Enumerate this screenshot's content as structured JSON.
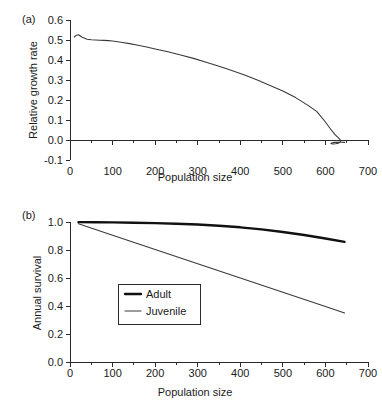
{
  "figure": {
    "panel_a_label": "(a)",
    "panel_b_label": "(b)",
    "xlabel": "Population size",
    "panel_a_ylabel": "Relative growth rate",
    "panel_b_ylabel": "Annual survival"
  },
  "chart_data": [
    {
      "type": "line",
      "panel": "(a)",
      "title": "",
      "xlabel": "Population size",
      "ylabel": "Relative growth rate",
      "xlim": [
        0,
        700
      ],
      "ylim": [
        -0.1,
        0.6
      ],
      "xticks": [
        0,
        100,
        200,
        300,
        400,
        500,
        600,
        700
      ],
      "xtick_labels": [
        "0",
        "100",
        "200",
        "300",
        "400",
        "500",
        "600",
        "700"
      ],
      "minor_xtick_step": 50,
      "yticks": [
        -0.1,
        0.0,
        0.1,
        0.2,
        0.3,
        0.4,
        0.5,
        0.6
      ],
      "ytick_labels": [
        "-0.1",
        "0.0",
        "0.1",
        "0.2",
        "0.3",
        "0.4",
        "0.5",
        "0.6"
      ],
      "grid": false,
      "legend": null,
      "series": [
        {
          "name": "Relative growth rate",
          "style": "thin-line",
          "color": "#3a3a3a",
          "x": [
            10,
            15,
            20,
            25,
            30,
            40,
            50,
            60,
            70,
            80,
            90,
            100,
            120,
            140,
            160,
            180,
            200,
            230,
            260,
            290,
            320,
            350,
            380,
            410,
            440,
            470,
            500,
            530,
            560,
            580,
            600,
            612,
            622,
            630,
            634,
            636,
            634,
            630,
            624,
            618,
            614,
            613,
            616,
            622,
            630,
            638,
            645
          ],
          "y": [
            0.515,
            0.524,
            0.526,
            0.519,
            0.512,
            0.504,
            0.501,
            0.5,
            0.499,
            0.498,
            0.497,
            0.495,
            0.489,
            0.482,
            0.474,
            0.465,
            0.455,
            0.441,
            0.425,
            0.408,
            0.389,
            0.369,
            0.348,
            0.325,
            0.3,
            0.273,
            0.245,
            0.212,
            0.172,
            0.142,
            0.09,
            0.055,
            0.028,
            0.012,
            0.003,
            -0.004,
            -0.011,
            -0.016,
            -0.019,
            -0.02,
            -0.019,
            -0.017,
            -0.014,
            -0.012,
            -0.011,
            -0.011,
            -0.012
          ]
        }
      ]
    },
    {
      "type": "line",
      "panel": "(b)",
      "title": "",
      "xlabel": "Population size",
      "ylabel": "Annual survival",
      "xlim": [
        0,
        700
      ],
      "ylim": [
        0.0,
        1.0
      ],
      "xticks": [
        0,
        100,
        200,
        300,
        400,
        500,
        600,
        700
      ],
      "xtick_labels": [
        "0",
        "100",
        "200",
        "300",
        "400",
        "500",
        "600",
        "700"
      ],
      "minor_xtick_step": 50,
      "yticks": [
        0.0,
        0.2,
        0.4,
        0.6,
        0.8,
        1.0
      ],
      "ytick_labels": [
        "0.0",
        "0.2",
        "0.4",
        "0.6",
        "0.8",
        "1.0"
      ],
      "grid": false,
      "legend": {
        "position": "center-left",
        "entries": [
          "Adult",
          "Juvenile"
        ]
      },
      "series": [
        {
          "name": "Adult",
          "style": "thick-line",
          "color": "#111111",
          "x": [
            20,
            60,
            100,
            150,
            200,
            250,
            300,
            350,
            400,
            450,
            500,
            550,
            600,
            645
          ],
          "y": [
            0.999,
            0.998,
            0.997,
            0.995,
            0.992,
            0.988,
            0.982,
            0.973,
            0.962,
            0.947,
            0.929,
            0.907,
            0.882,
            0.858
          ]
        },
        {
          "name": "Juvenile",
          "style": "thin-line",
          "color": "#4a4a4a",
          "x": [
            20,
            100,
            200,
            300,
            400,
            500,
            600,
            645
          ],
          "y": [
            0.988,
            0.906,
            0.804,
            0.702,
            0.6,
            0.498,
            0.396,
            0.35
          ]
        }
      ]
    }
  ]
}
